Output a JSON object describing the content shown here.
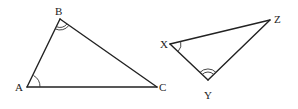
{
  "diagram": {
    "type": "similar-triangles",
    "triangles": [
      {
        "name": "ABC",
        "vertices": {
          "A": {
            "label": "A",
            "x": 27,
            "y": 87
          },
          "B": {
            "label": "B",
            "x": 60,
            "y": 19
          },
          "C": {
            "label": "C",
            "x": 157,
            "y": 87
          }
        },
        "angle_marks": [
          {
            "vertex": "A",
            "arcs": 1
          },
          {
            "vertex": "B",
            "arcs": 2
          }
        ]
      },
      {
        "name": "XYZ",
        "vertices": {
          "X": {
            "label": "X",
            "x": 170,
            "y": 44
          },
          "Y": {
            "label": "Y",
            "x": 208,
            "y": 80
          },
          "Z": {
            "label": "Z",
            "x": 270,
            "y": 20
          }
        },
        "angle_marks": [
          {
            "vertex": "X",
            "arcs": 1
          },
          {
            "vertex": "Y",
            "arcs": 2
          }
        ]
      }
    ],
    "labels": {
      "A": "A",
      "B": "B",
      "C": "C",
      "X": "X",
      "Y": "Y",
      "Z": "Z"
    },
    "colors": {
      "line": "#222222",
      "background": "#ffffff"
    }
  }
}
